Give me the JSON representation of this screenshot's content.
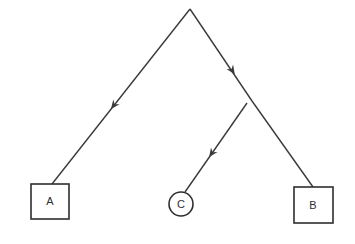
{
  "diagram": {
    "type": "tree",
    "root": {
      "x": 190,
      "y": 9
    },
    "branch_point": {
      "x": 252,
      "y": 101
    },
    "nodes": [
      {
        "id": "A",
        "label": "A",
        "shape": "square",
        "x": 31,
        "y": 184,
        "w": 38,
        "h": 35,
        "anchor": {
          "x": 52,
          "y": 184
        }
      },
      {
        "id": "C",
        "label": "C",
        "shape": "circle",
        "cx": 181,
        "cy": 204,
        "r": 12,
        "anchor": {
          "x": 185,
          "y": 192
        }
      },
      {
        "id": "B",
        "label": "B",
        "shape": "square",
        "x": 294,
        "y": 187,
        "w": 39,
        "h": 36,
        "anchor": {
          "x": 313,
          "y": 187
        }
      }
    ],
    "edges": [
      {
        "from": "root",
        "to": "A",
        "arrow": {
          "x": 114,
          "y": 105
        }
      },
      {
        "from": "root",
        "to": "branch_point",
        "arrow": {
          "x": 232,
          "y": 70
        }
      },
      {
        "from": "branch_point",
        "to": "B",
        "arrow": null
      },
      {
        "from": "branch_point",
        "to": "C",
        "arrow": {
          "x": 212,
          "y": 153
        }
      }
    ],
    "colors": {
      "line": "#3a3a3a",
      "background": "#ffffff"
    }
  }
}
